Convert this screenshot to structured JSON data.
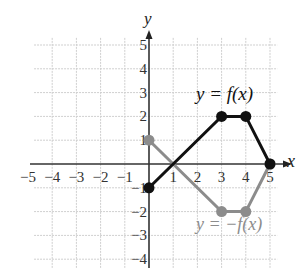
{
  "chart_data": {
    "type": "line",
    "title": "",
    "xlabel": "x",
    "ylabel": "y",
    "xlim": [
      -5,
      5
    ],
    "ylim": [
      -4,
      5
    ],
    "grid": true,
    "x_ticks": [
      "-5",
      "-4",
      "-3",
      "-2",
      "-1",
      "1",
      "2",
      "3",
      "4",
      "5"
    ],
    "y_ticks": [
      "5",
      "4",
      "3",
      "2",
      "1",
      "-1",
      "-2",
      "-3",
      "-4"
    ],
    "series": [
      {
        "name": "y = f(x)",
        "color": "#111111",
        "points": [
          [
            0,
            -1
          ],
          [
            3,
            2
          ],
          [
            4,
            2
          ],
          [
            5,
            0
          ]
        ]
      },
      {
        "name": "y = -f(x)",
        "color": "#8c8c8c",
        "points": [
          [
            0,
            1
          ],
          [
            3,
            -2
          ],
          [
            4,
            -2
          ],
          [
            5,
            0
          ]
        ]
      }
    ],
    "annotations": [
      {
        "text": "y = f(x)",
        "x": 3.5,
        "y": 3
      },
      {
        "text": "y = −f(x)",
        "x": 3.9,
        "y": -2.6
      }
    ]
  },
  "labels": {
    "x_axis": "x",
    "y_axis": "y",
    "f_label": "y = f(x)",
    "negf_label": "y = −f(x)"
  }
}
